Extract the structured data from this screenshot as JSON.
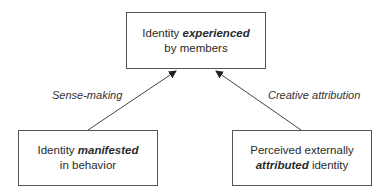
{
  "diagram": {
    "top_box": {
      "line1_prefix": "Identity ",
      "line1_emphasis": "experienced",
      "line2": "by members"
    },
    "left_box": {
      "line1_prefix": "Identity ",
      "line1_emphasis": "manifested",
      "line2": "in behavior"
    },
    "right_box": {
      "line1": "Perceived externally",
      "line2_emphasis": "attributed",
      "line2_suffix": " identity"
    },
    "edges": [
      {
        "from": "left_box",
        "to": "top_box",
        "label": "Sense-making"
      },
      {
        "from": "right_box",
        "to": "top_box",
        "label": "Creative attribution"
      }
    ],
    "colors": {
      "line": "#444444",
      "text": "#2a2a2a",
      "background": "#ffffff"
    }
  }
}
